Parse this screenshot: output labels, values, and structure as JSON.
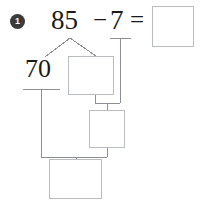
{
  "worksheet": {
    "item_number": "1",
    "equation": {
      "minuend": "85",
      "minus_operator": "−",
      "subtrahend": "7",
      "equals_operator": "=",
      "result_value": ""
    },
    "number_bond": {
      "tens_part_label": "70",
      "branch_box_value": "",
      "middle_box_value": "",
      "bottom_box_value": ""
    },
    "colors": {
      "ink": "#1a1a1a",
      "box_border": "#b9bcc0",
      "connector_line": "#8c9096",
      "bullet_fill": "#3a3a3a"
    }
  }
}
